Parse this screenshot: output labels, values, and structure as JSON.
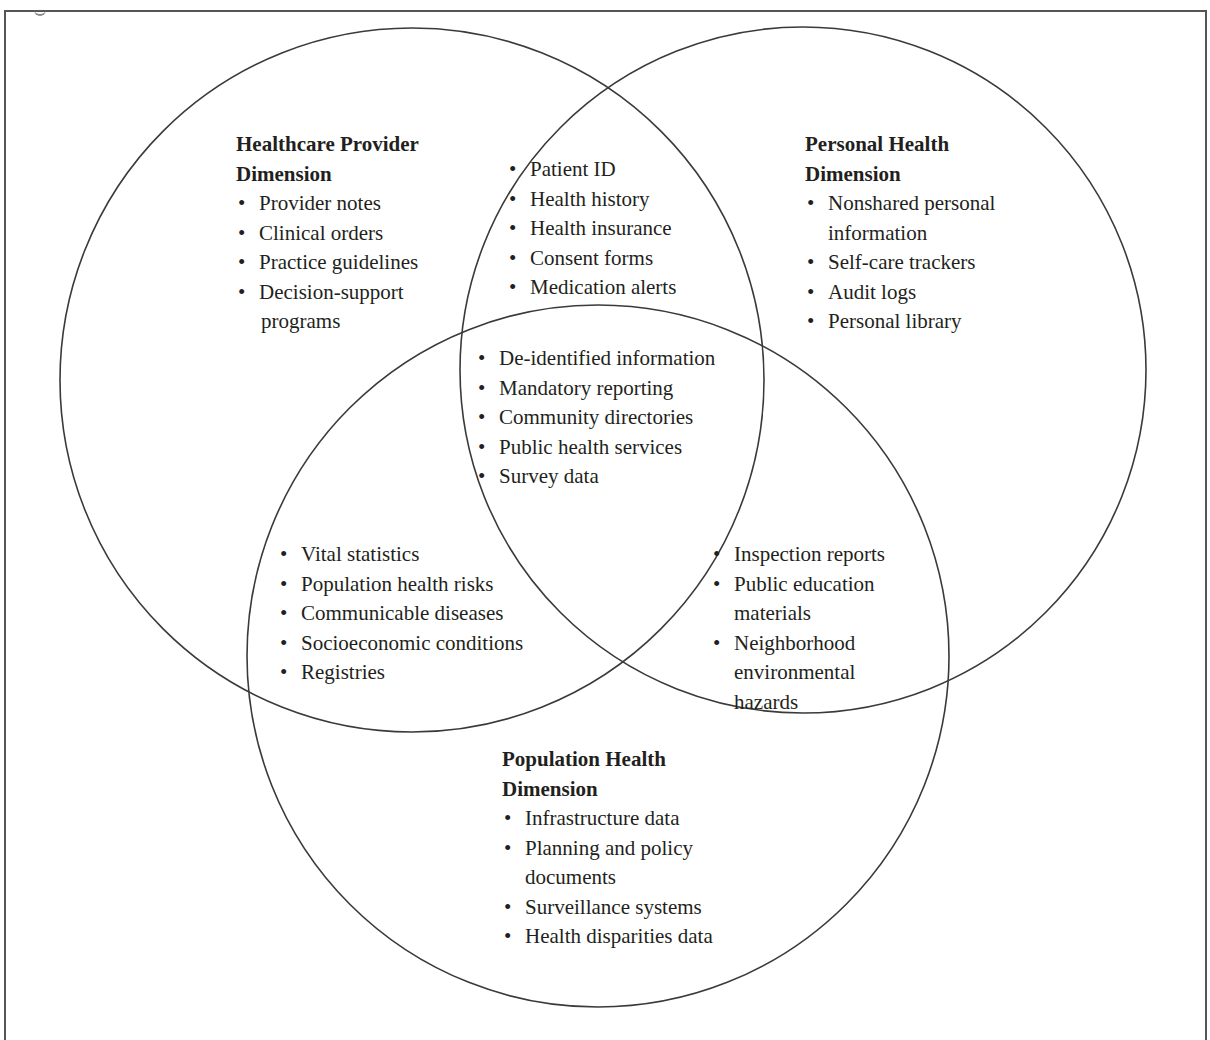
{
  "figure": {
    "header_fragment": "",
    "circles": [
      {
        "id": "healthcare-provider",
        "cx": 412,
        "cy": 380,
        "r": 352
      },
      {
        "id": "personal-health",
        "cx": 803,
        "cy": 370,
        "r": 343
      },
      {
        "id": "population-health",
        "cx": 598,
        "cy": 656,
        "r": 351
      }
    ],
    "stroke_color": "#3a3a3a"
  },
  "regions": {
    "healthcare_provider": {
      "title_line1": "Healthcare Provider",
      "title_line2": "Dimension",
      "items": [
        {
          "line1": "Provider notes"
        },
        {
          "line1": "Clinical orders"
        },
        {
          "line1": "Practice guidelines"
        },
        {
          "line1": "Decision-support",
          "line2": "programs"
        }
      ]
    },
    "provider_personal_overlap": {
      "items": [
        {
          "line1": "Patient ID"
        },
        {
          "line1": "Health history"
        },
        {
          "line1": "Health insurance"
        },
        {
          "line1": "Consent forms"
        },
        {
          "line1": "Medication alerts"
        }
      ]
    },
    "personal_health": {
      "title_line1": "Personal Health",
      "title_line2": "Dimension",
      "items": [
        {
          "line1": "Nonshared personal",
          "line2": "information"
        },
        {
          "line1": "Self-care trackers"
        },
        {
          "line1": "Audit logs"
        },
        {
          "line1": "Personal library"
        }
      ]
    },
    "center_overlap": {
      "items": [
        {
          "line1": "De-identified information"
        },
        {
          "line1": "Mandatory reporting"
        },
        {
          "line1": "Community directories"
        },
        {
          "line1": "Public health services"
        },
        {
          "line1": "Survey data"
        }
      ]
    },
    "provider_population_overlap": {
      "items": [
        {
          "line1": "Vital statistics"
        },
        {
          "line1": "Population health risks"
        },
        {
          "line1": "Communicable diseases"
        },
        {
          "line1": "Socioeconomic conditions"
        },
        {
          "line1": "Registries"
        }
      ]
    },
    "personal_population_overlap": {
      "items": [
        {
          "line1": "Inspection reports"
        },
        {
          "line1": "Public education",
          "line2": "materials"
        },
        {
          "line1": "Neighborhood",
          "line2": "environmental",
          "line3": "hazards"
        }
      ]
    },
    "population_health": {
      "title_line1": "Population Health",
      "title_line2": "Dimension",
      "items": [
        {
          "line1": "Infrastructure data"
        },
        {
          "line1": "Planning and policy",
          "line2": "documents"
        },
        {
          "line1": "Surveillance systems"
        },
        {
          "line1": "Health disparities data"
        }
      ]
    }
  }
}
